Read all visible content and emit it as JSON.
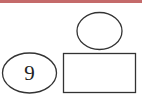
{
  "diagram": {
    "top_band_color": "#c46a6a",
    "stroke_color": "#333333",
    "shapes": [
      {
        "type": "ellipse",
        "role": "top-ellipse",
        "label": ""
      },
      {
        "type": "rectangle",
        "role": "answer-box",
        "label": ""
      },
      {
        "type": "ellipse",
        "role": "left-ellipse",
        "label": "9"
      }
    ]
  }
}
